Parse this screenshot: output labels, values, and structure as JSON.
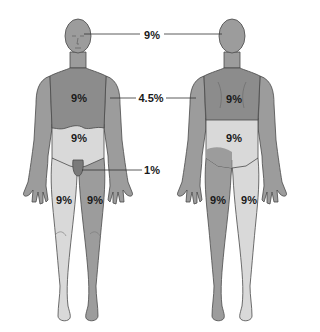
{
  "diagram": {
    "type": "rule-of-nines body surface area",
    "colors": {
      "medium": "#9c9c9c",
      "dark": "#8c8c8c",
      "light": "#d9d9d9",
      "outline": "#4a4a4a",
      "leader": "#333333"
    },
    "callouts": {
      "head": "9%",
      "arm": "4.5%",
      "genitals": "1%"
    },
    "front": {
      "chest": "9%",
      "abdomen": "9%",
      "left_leg": "9%",
      "right_leg": "9%"
    },
    "back": {
      "upper_back": "9%",
      "lower_back": "9%",
      "left_leg": "9%",
      "right_leg": "9%"
    }
  }
}
